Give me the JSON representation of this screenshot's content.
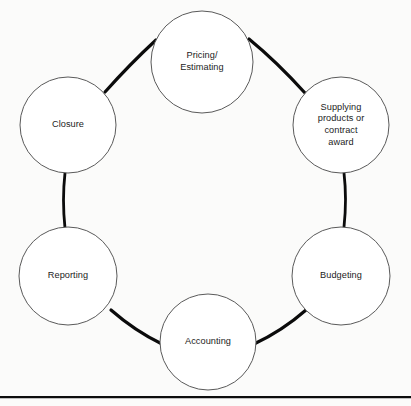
{
  "diagram": {
    "type": "circular-process-cycle",
    "title": "",
    "background_color": "#fbfbfa",
    "circle_fill": "#ffffff",
    "circle_stroke": "#5a5a5a",
    "connector_color": "#0b0b0b",
    "text_color": "#1c1c1c",
    "node_count": 6,
    "nodes": [
      {
        "id": "pricing-estimating",
        "label": "Pricing/ Estimating",
        "lines": [
          "Pricing/",
          "Estimating"
        ],
        "position": "top",
        "cx": 202,
        "cy": 62,
        "r": 51
      },
      {
        "id": "supplying-products-or-contract-award",
        "label": "Supplying products or contract award",
        "lines": [
          "Supplying",
          "products or",
          "contract",
          "award"
        ],
        "position": "upper-right",
        "cx": 341,
        "cy": 125,
        "r": 48
      },
      {
        "id": "budgeting",
        "label": "Budgeting",
        "lines": [
          "Budgeting"
        ],
        "position": "lower-right",
        "cx": 341,
        "cy": 276,
        "r": 49
      },
      {
        "id": "accounting",
        "label": "Accounting",
        "lines": [
          "Accounting"
        ],
        "position": "bottom",
        "cx": 208,
        "cy": 342,
        "r": 48
      },
      {
        "id": "reporting",
        "label": "Reporting",
        "lines": [
          "Reporting"
        ],
        "position": "lower-left",
        "cx": 68,
        "cy": 276,
        "r": 49
      },
      {
        "id": "closure",
        "label": "Closure",
        "lines": [
          "Closure"
        ],
        "position": "upper-left",
        "cx": 68,
        "cy": 125,
        "r": 48
      }
    ],
    "connectors": [
      {
        "id": "closure-to-pricing",
        "from": "closure",
        "to": "pricing-estimating",
        "style": "thick-arc"
      },
      {
        "id": "pricing-to-supplying",
        "from": "pricing-estimating",
        "to": "supplying-products-or-contract-award",
        "style": "thick-arc"
      },
      {
        "id": "supplying-to-budgeting",
        "from": "supplying-products-or-contract-award",
        "to": "budgeting",
        "style": "thin-arc"
      },
      {
        "id": "budgeting-to-accounting",
        "from": "budgeting",
        "to": "accounting",
        "style": "thick-arc"
      },
      {
        "id": "accounting-to-reporting",
        "from": "accounting",
        "to": "reporting",
        "style": "thick-arc"
      },
      {
        "id": "reporting-to-closure",
        "from": "reporting",
        "to": "closure",
        "style": "thin-arc"
      }
    ],
    "footer_rule": {
      "visible": true,
      "color": "#0d0d0d"
    }
  }
}
